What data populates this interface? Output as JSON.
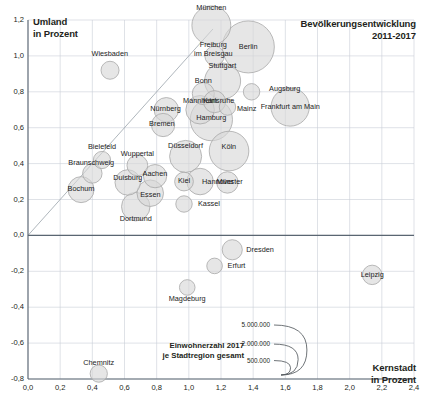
{
  "chart_data": {
    "type": "scatter",
    "title": "Bevölkerungsentwicklung\n2011-2017",
    "xlabel": "Kernstadt\nin Prozent",
    "ylabel": "Umland\nin Prozent",
    "xlim": [
      0.0,
      2.4
    ],
    "ylim": [
      -0.8,
      1.2
    ],
    "grid": true,
    "x_ticks": [
      "0,0",
      "0,2",
      "0,4",
      "0,6",
      "0,8",
      "1,0",
      "1,2",
      "1,4",
      "1,6",
      "1,8",
      "2,0",
      "2,2",
      "2,4"
    ],
    "x_tick_values": [
      0.0,
      0.2,
      0.4,
      0.6,
      0.8,
      1.0,
      1.2,
      1.4,
      1.6,
      1.8,
      2.0,
      2.2,
      2.4
    ],
    "y_ticks": [
      "1,2",
      "1,0",
      "0,8",
      "0,6",
      "0,4",
      "0,2",
      "0,0",
      "-0,2",
      "-0,4",
      "-0,6",
      "-0,8"
    ],
    "y_tick_values": [
      1.2,
      1.0,
      0.8,
      0.6,
      0.4,
      0.2,
      0.0,
      -0.2,
      -0.4,
      -0.6,
      -0.8
    ],
    "size_legend": {
      "title": "Einwohnerzahl 2017\nje Stadtregion gesamt",
      "entries": [
        "5.000.000",
        "2.000.000",
        "500.000"
      ],
      "values": [
        5000000,
        2000000,
        500000
      ]
    },
    "identity_line": {
      "from": [
        0.0,
        0.0
      ],
      "to": [
        1.15,
        1.15
      ]
    },
    "bubble_fill": "#d6d6d6",
    "bubble_stroke": "#a8a8a8",
    "grid_color": "#c9cfd6",
    "axis_color": "#5a6672",
    "points": [
      {
        "label": "München",
        "x": 1.14,
        "y": 1.17,
        "size": 2800000,
        "lx": 0,
        "ly": -17
      },
      {
        "label": "Berlin",
        "x": 1.37,
        "y": 1.05,
        "size": 5000000,
        "lx": 0,
        "ly": 0
      },
      {
        "label": "Freiburg\nim Breisgau",
        "x": 1.16,
        "y": 1.0,
        "size": 700000,
        "lx": -1,
        "ly": -6
      },
      {
        "label": "Wiesbaden",
        "x": 0.51,
        "y": 0.92,
        "size": 600000,
        "lx": 0,
        "ly": -16
      },
      {
        "label": "Stuttgart",
        "x": 1.21,
        "y": 0.86,
        "size": 2400000,
        "lx": 0,
        "ly": -15
      },
      {
        "label": "Augsburg",
        "x": 1.39,
        "y": 0.8,
        "size": 500000,
        "lx": 33,
        "ly": -3
      },
      {
        "label": "Bonn",
        "x": 1.09,
        "y": 0.79,
        "size": 900000,
        "lx": 0,
        "ly": -13
      },
      {
        "label": "Karlsruhe",
        "x": 1.16,
        "y": 0.745,
        "size": 900000,
        "lx": 4,
        "ly": -1
      },
      {
        "label": "Mainz",
        "x": 1.24,
        "y": 0.715,
        "size": 500000,
        "lx": 19,
        "ly": 2
      },
      {
        "label": "Frankfurt am Main",
        "x": 1.63,
        "y": 0.715,
        "size": 2700000,
        "lx": 0,
        "ly": 0
      },
      {
        "label": "Nürnberg",
        "x": 0.86,
        "y": 0.7,
        "size": 1100000,
        "lx": -1,
        "ly": -1
      },
      {
        "label": "Mannheim",
        "x": 1.07,
        "y": 0.7,
        "size": 1500000,
        "lx": 0,
        "ly": -9
      },
      {
        "label": "Hamburg",
        "x": 1.14,
        "y": 0.645,
        "size": 3300000,
        "lx": 0,
        "ly": -2
      },
      {
        "label": "Bremen",
        "x": 0.84,
        "y": 0.615,
        "size": 1000000,
        "lx": -1,
        "ly": -1
      },
      {
        "label": "Köln",
        "x": 1.25,
        "y": 0.47,
        "size": 2900000,
        "lx": 0,
        "ly": -4
      },
      {
        "label": "Düsseldorf",
        "x": 0.98,
        "y": 0.44,
        "size": 1900000,
        "lx": 0,
        "ly": -10
      },
      {
        "label": "Bielefeld",
        "x": 0.46,
        "y": 0.42,
        "size": 550000,
        "lx": 0,
        "ly": -13
      },
      {
        "label": "Wuppertal",
        "x": 0.68,
        "y": 0.39,
        "size": 800000,
        "lx": 0,
        "ly": -11
      },
      {
        "label": "Braunschweig",
        "x": 0.4,
        "y": 0.345,
        "size": 700000,
        "lx": -1,
        "ly": -10
      },
      {
        "label": "Aachen",
        "x": 0.79,
        "y": 0.33,
        "size": 1000000,
        "lx": 0,
        "ly": -2
      },
      {
        "label": "Kiel",
        "x": 0.97,
        "y": 0.3,
        "size": 650000,
        "lx": 0,
        "ly": -1
      },
      {
        "label": "Hannover",
        "x": 1.07,
        "y": 0.3,
        "size": 1300000,
        "lx": 18,
        "ly": 0
      },
      {
        "label": "Duisburg",
        "x": 0.62,
        "y": 0.295,
        "size": 1200000,
        "lx": 0,
        "ly": -4
      },
      {
        "label": "Münster",
        "x": 1.24,
        "y": 0.295,
        "size": 850000,
        "lx": 2,
        "ly": 0
      },
      {
        "label": "Bochum",
        "x": 0.33,
        "y": 0.255,
        "size": 1250000,
        "lx": 0,
        "ly": -1
      },
      {
        "label": "Essen",
        "x": 0.76,
        "y": 0.235,
        "size": 1300000,
        "lx": 0,
        "ly": 2
      },
      {
        "label": "Kassel",
        "x": 0.97,
        "y": 0.175,
        "size": 500000,
        "lx": 25,
        "ly": 0
      },
      {
        "label": "Dortmund",
        "x": 0.67,
        "y": 0.16,
        "size": 1500000,
        "lx": 0,
        "ly": 12
      },
      {
        "label": "Dresden",
        "x": 1.27,
        "y": -0.08,
        "size": 750000,
        "lx": 28,
        "ly": 0
      },
      {
        "label": "Erfurt",
        "x": 1.16,
        "y": -0.17,
        "size": 450000,
        "lx": 22,
        "ly": 0
      },
      {
        "label": "Leipzig",
        "x": 2.14,
        "y": -0.22,
        "size": 700000,
        "lx": 0,
        "ly": 0
      },
      {
        "label": "Magdeburg",
        "x": 0.99,
        "y": -0.29,
        "size": 450000,
        "lx": 0,
        "ly": 12
      },
      {
        "label": "Chemnitz",
        "x": 0.44,
        "y": -0.77,
        "size": 550000,
        "lx": 0,
        "ly": -11
      }
    ]
  }
}
